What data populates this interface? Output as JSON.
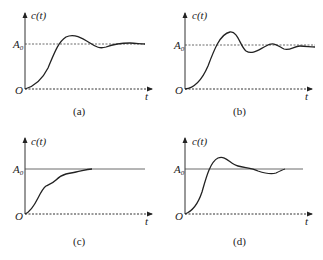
{
  "figure": {
    "panels": [
      {
        "id": "a",
        "caption": "(a)",
        "y_label": "c(t)",
        "x_label": "t",
        "origin_label": "O",
        "ref_label_main": "A",
        "ref_label_sub": "0",
        "reference_line": "dashed",
        "response": "underdamped, small overshoot, slowly decaying oscillation"
      },
      {
        "id": "b",
        "caption": "(b)",
        "y_label": "c(t)",
        "x_label": "t",
        "origin_label": "O",
        "ref_label_main": "A",
        "ref_label_sub": "0",
        "reference_line": "dashed",
        "response": "underdamped, large overshoot, decaying oscillation"
      },
      {
        "id": "c",
        "caption": "(c)",
        "y_label": "c(t)",
        "x_label": "t",
        "origin_label": "O",
        "ref_label_main": "A",
        "ref_label_sub": "0",
        "reference_line": "solid",
        "response": "monotonic rise with ripples, no overshoot"
      },
      {
        "id": "d",
        "caption": "(d)",
        "y_label": "c(t)",
        "x_label": "t",
        "origin_label": "O",
        "ref_label_main": "A",
        "ref_label_sub": "0",
        "reference_line": "solid",
        "response": "overshoot then settles with slight undershoot"
      }
    ]
  }
}
